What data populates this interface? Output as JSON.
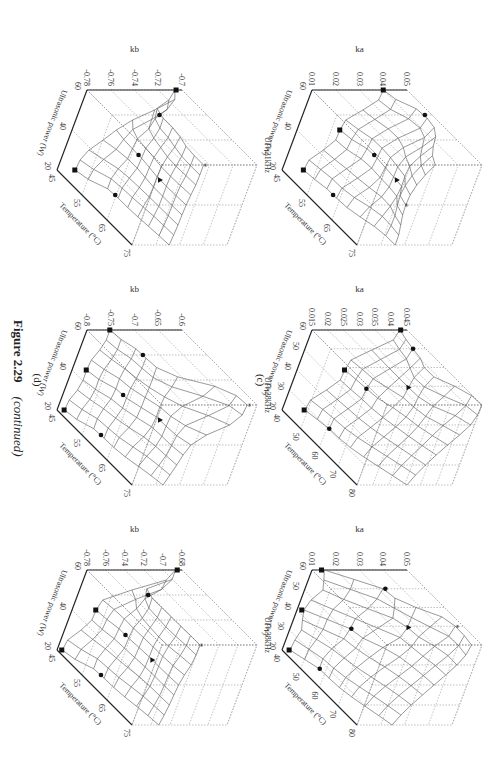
{
  "figure": {
    "number_label": "Figure 2.29",
    "continued_label": "(continued)"
  },
  "rows": [
    {
      "label": "(c)"
    },
    {
      "label": "(d)"
    }
  ],
  "chart_data": [
    {
      "type": "surface3d",
      "row": "c",
      "title": "UF=21kHz",
      "zlabel": "ka",
      "xlabel": "Ultrasonic power (W)",
      "ylabel": "Temperature (°C)",
      "zticks": [
        "0.01",
        "0.02",
        "0.03",
        "0.04",
        "0.05"
      ],
      "zlim": [
        0.01,
        0.05
      ],
      "xticks": [
        "20",
        "40",
        "60"
      ],
      "yticks": [
        "45",
        "55",
        "65",
        "75"
      ],
      "points": [
        {
          "marker": "square",
          "power": 60,
          "temp": 45,
          "z": 0.04
        },
        {
          "marker": "square",
          "power": 40,
          "temp": 45,
          "z": 0.028
        },
        {
          "marker": "square",
          "power": 20,
          "temp": 45,
          "z": 0.019
        },
        {
          "marker": "circle",
          "power": 60,
          "temp": 55,
          "z": 0.047
        },
        {
          "marker": "circle",
          "power": 40,
          "temp": 55,
          "z": 0.032
        },
        {
          "marker": "circle",
          "power": 20,
          "temp": 55,
          "z": 0.021
        },
        {
          "marker": "triangle",
          "power": 40,
          "temp": 65,
          "z": 0.031
        },
        {
          "marker": "star",
          "power": 40,
          "temp": 75,
          "z": 0.024
        }
      ]
    },
    {
      "type": "surface3d",
      "row": "c",
      "title": "UF=28kHz",
      "zlabel": "ka",
      "xlabel": "Ultrasonic power (W)",
      "ylabel": "Temperature (°C)",
      "zticks": [
        "0.015",
        "0.02",
        "0.025",
        "0.03",
        "0.035",
        "0.04",
        "0.045"
      ],
      "zlim": [
        0.015,
        0.045
      ],
      "xticks": [
        "20",
        "30",
        "40",
        "50",
        "60"
      ],
      "yticks": [
        "40",
        "50",
        "60",
        "70",
        "80"
      ],
      "points": [
        {
          "marker": "square",
          "power": 60,
          "temp": 40,
          "z": 0.043
        },
        {
          "marker": "square",
          "power": 40,
          "temp": 40,
          "z": 0.03
        },
        {
          "marker": "square",
          "power": 20,
          "temp": 40,
          "z": 0.022
        },
        {
          "marker": "circle",
          "power": 60,
          "temp": 50,
          "z": 0.041
        },
        {
          "marker": "circle",
          "power": 40,
          "temp": 50,
          "z": 0.031
        },
        {
          "marker": "circle",
          "power": 20,
          "temp": 50,
          "z": 0.024
        },
        {
          "marker": "triangle",
          "power": 50,
          "temp": 60,
          "z": 0.036
        },
        {
          "marker": "star",
          "power": 60,
          "temp": 80,
          "z": 0.045
        }
      ]
    },
    {
      "type": "surface3d",
      "row": "c",
      "title": "UF=38kHz",
      "zlabel": "ka",
      "xlabel": "Ultrasonic power (W)",
      "ylabel": "Temperature (°C)",
      "zticks": [
        "0.01",
        "0.02",
        "0.03",
        "0.04",
        "0.05"
      ],
      "zlim": [
        0.01,
        0.05
      ],
      "xticks": [
        "20",
        "30",
        "40",
        "50",
        "60"
      ],
      "yticks": [
        "40",
        "50",
        "60",
        "70",
        "80"
      ],
      "points": [
        {
          "marker": "square",
          "power": 60,
          "temp": 40,
          "z": 0.014
        },
        {
          "marker": "square",
          "power": 40,
          "temp": 40,
          "z": 0.012
        },
        {
          "marker": "square",
          "power": 20,
          "temp": 40,
          "z": 0.013
        },
        {
          "marker": "circle",
          "power": 60,
          "temp": 50,
          "z": 0.033
        },
        {
          "marker": "circle",
          "power": 40,
          "temp": 50,
          "z": 0.025
        },
        {
          "marker": "circle",
          "power": 20,
          "temp": 50,
          "z": 0.018
        },
        {
          "marker": "triangle",
          "power": 50,
          "temp": 60,
          "z": 0.038
        },
        {
          "marker": "star",
          "power": 60,
          "temp": 70,
          "z": 0.047
        }
      ]
    },
    {
      "type": "surface3d",
      "row": "d",
      "title": "UF=21kHz",
      "zlabel": "kb",
      "xlabel": "Ultrasonic power (W)",
      "ylabel": "Temperature (°C)",
      "zticks": [
        "-0.78",
        "-0.76",
        "-0.74",
        "-0.72",
        "-0.7"
      ],
      "zlim": [
        -0.78,
        -0.7
      ],
      "xticks": [
        "20",
        "40",
        "60"
      ],
      "yticks": [
        "45",
        "55",
        "65",
        "75"
      ],
      "points": [
        {
          "marker": "square",
          "power": 60,
          "temp": 45,
          "z": -0.705
        },
        {
          "marker": "square",
          "power": 20,
          "temp": 45,
          "z": -0.765
        },
        {
          "marker": "circle",
          "power": 60,
          "temp": 55,
          "z": -0.74
        },
        {
          "marker": "circle",
          "power": 40,
          "temp": 55,
          "z": -0.745
        },
        {
          "marker": "circle",
          "power": 20,
          "temp": 55,
          "z": -0.752
        },
        {
          "marker": "triangle",
          "power": 40,
          "temp": 65,
          "z": -0.748
        },
        {
          "marker": "star",
          "power": 60,
          "temp": 75,
          "z": -0.745
        }
      ]
    },
    {
      "type": "surface3d",
      "row": "d",
      "title": "UF=28kHz",
      "zlabel": "kb",
      "xlabel": "Ultrasonic power (W)",
      "ylabel": "Temperature (°C)",
      "zticks": [
        "-0.8",
        "-0.75",
        "-0.7",
        "-0.65",
        "-0.6"
      ],
      "zlim": [
        -0.8,
        -0.6
      ],
      "xticks": [
        "20",
        "40",
        "60"
      ],
      "yticks": [
        "45",
        "55",
        "65",
        "75"
      ],
      "points": [
        {
          "marker": "square",
          "power": 60,
          "temp": 45,
          "z": -0.752
        },
        {
          "marker": "square",
          "power": 40,
          "temp": 45,
          "z": -0.77
        },
        {
          "marker": "square",
          "power": 20,
          "temp": 45,
          "z": -0.785
        },
        {
          "marker": "circle",
          "power": 60,
          "temp": 55,
          "z": -0.735
        },
        {
          "marker": "circle",
          "power": 40,
          "temp": 55,
          "z": -0.745
        },
        {
          "marker": "circle",
          "power": 20,
          "temp": 55,
          "z": -0.76
        },
        {
          "marker": "triangle",
          "power": 40,
          "temp": 65,
          "z": -0.72
        },
        {
          "marker": "star",
          "power": 60,
          "temp": 75,
          "z": -0.62
        }
      ]
    },
    {
      "type": "surface3d",
      "row": "d",
      "title": "UF=38kHz",
      "zlabel": "kb",
      "xlabel": "Ultrasonic power (W)",
      "ylabel": "Temperature (°C)",
      "zticks": [
        "-0.78",
        "-0.76",
        "-0.74",
        "-0.72",
        "-0.7",
        "-0.68"
      ],
      "zlim": [
        -0.78,
        -0.68
      ],
      "xticks": [
        "20",
        "40",
        "60"
      ],
      "yticks": [
        "45",
        "55",
        "65",
        "75"
      ],
      "points": [
        {
          "marker": "square",
          "power": 60,
          "temp": 45,
          "z": -0.685
        },
        {
          "marker": "square",
          "power": 40,
          "temp": 45,
          "z": -0.755
        },
        {
          "marker": "square",
          "power": 20,
          "temp": 45,
          "z": -0.775
        },
        {
          "marker": "circle",
          "power": 60,
          "temp": 55,
          "z": -0.742
        },
        {
          "marker": "circle",
          "power": 40,
          "temp": 55,
          "z": -0.75
        },
        {
          "marker": "circle",
          "power": 20,
          "temp": 55,
          "z": -0.76
        },
        {
          "marker": "triangle",
          "power": 40,
          "temp": 65,
          "z": -0.748
        },
        {
          "marker": "star",
          "power": 60,
          "temp": 75,
          "z": -0.74
        }
      ]
    }
  ]
}
